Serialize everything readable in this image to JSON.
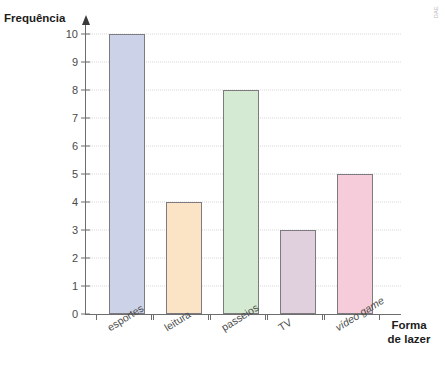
{
  "credit": "DAE",
  "chart_data": {
    "type": "bar",
    "title": "",
    "xlabel": "Forma de lazer",
    "ylabel": "Frequência",
    "categories": [
      "esportes",
      "leitura",
      "passeios",
      "TV",
      "vídeo game"
    ],
    "values": [
      10,
      4,
      8,
      3,
      5
    ],
    "ylim": [
      0,
      10
    ],
    "ytick_labels": [
      "0",
      "1",
      "2",
      "3",
      "4",
      "5",
      "6",
      "7",
      "8",
      "9",
      "10"
    ],
    "grid": true,
    "legend": "none",
    "bar_colors": [
      "#ccd3e8",
      "#fbe3c6",
      "#d5ead2",
      "#e0d0dd",
      "#f7ccda"
    ],
    "bar_border_color": "#7d7a80",
    "axis_color": "#6d6d6d",
    "gridline_color": "#d7d7d7",
    "label_italic": [
      false,
      false,
      false,
      false,
      true
    ]
  },
  "xlabel_lines": [
    "Forma",
    "de lazer"
  ]
}
